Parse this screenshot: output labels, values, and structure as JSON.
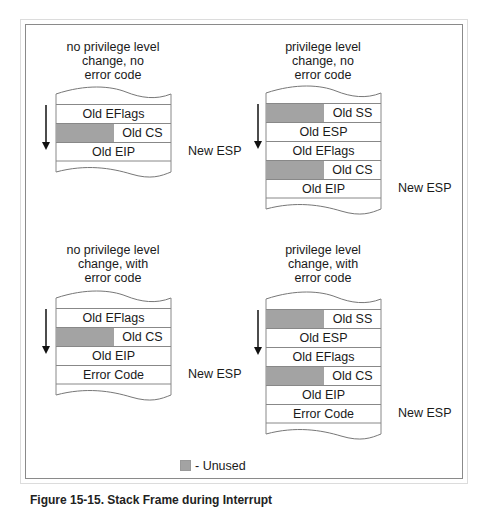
{
  "legend": {
    "unused_label": "- Unused",
    "unused_color": "#a3a3a3"
  },
  "caption": "Figure 15-15. Stack Frame during Interrupt",
  "panels": [
    {
      "title": [
        "no privilege level",
        "change, no",
        "error code"
      ],
      "rows": [
        {
          "label": "Old EFlags",
          "unused": false
        },
        {
          "label": "Old CS",
          "unused": true
        },
        {
          "label": "Old EIP",
          "unused": false
        }
      ],
      "esp_label": "New ESP",
      "esp_row": 2
    },
    {
      "title": [
        "privilege level",
        "change, no",
        "error code"
      ],
      "rows": [
        {
          "label": "Old SS",
          "unused": true
        },
        {
          "label": "Old ESP",
          "unused": false
        },
        {
          "label": "Old EFlags",
          "unused": false
        },
        {
          "label": "Old CS",
          "unused": true
        },
        {
          "label": "Old EIP",
          "unused": false
        }
      ],
      "esp_label": "New ESP",
      "esp_row": 4
    },
    {
      "title": [
        "no privilege level",
        "change, with",
        "error code"
      ],
      "rows": [
        {
          "label": "Old EFlags",
          "unused": false
        },
        {
          "label": "Old CS",
          "unused": true
        },
        {
          "label": "Old EIP",
          "unused": false
        },
        {
          "label": "Error Code",
          "unused": false
        }
      ],
      "esp_label": "New ESP",
      "esp_row": 3
    },
    {
      "title": [
        "privilege level",
        "change, with",
        "error code"
      ],
      "rows": [
        {
          "label": "Old SS",
          "unused": true
        },
        {
          "label": "Old ESP",
          "unused": false
        },
        {
          "label": "Old EFlags",
          "unused": false
        },
        {
          "label": "Old CS",
          "unused": true
        },
        {
          "label": "Old EIP",
          "unused": false
        },
        {
          "label": "Error Code",
          "unused": false
        }
      ],
      "esp_label": "New ESP",
      "esp_row": 5
    }
  ]
}
